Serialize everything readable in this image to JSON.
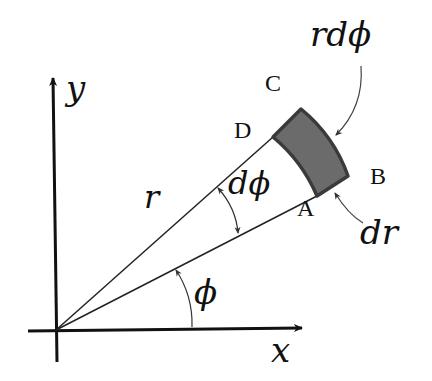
{
  "diagram": {
    "axes": {
      "x_label": "x",
      "y_label": "y"
    },
    "labels": {
      "r": "r",
      "dphi": "dϕ",
      "phi": "ϕ",
      "rdphi": "rdϕ",
      "dr": "dr",
      "A": "A",
      "B": "B",
      "C": "C",
      "D": "D"
    },
    "colors": {
      "element_fill": "#6b6b6b",
      "element_stroke": "#3a3a3a",
      "line": "#222222"
    }
  }
}
